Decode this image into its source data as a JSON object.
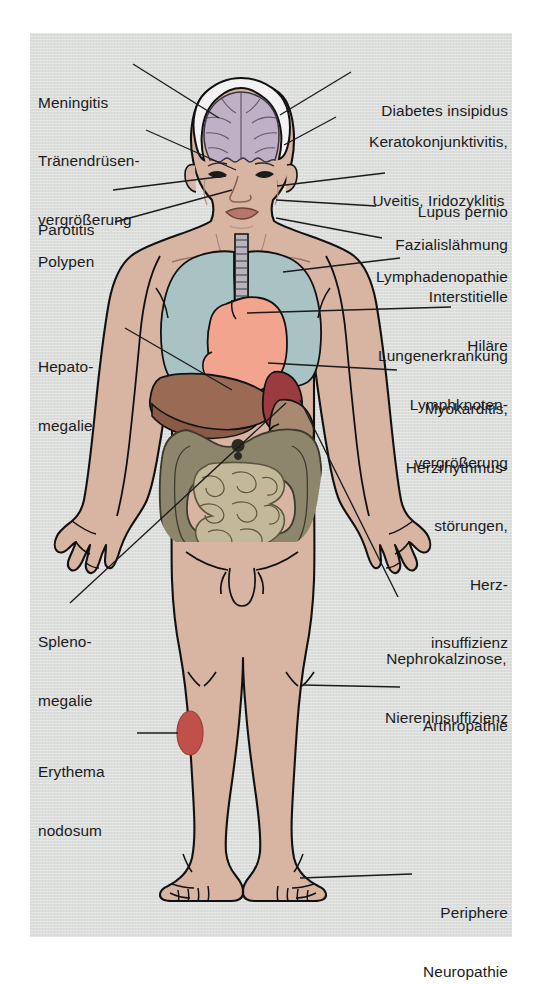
{
  "figure": {
    "background_color": "#dcdedc",
    "page_color": "#ffffff",
    "line_color": "#1b1b1b",
    "text_color": "#1b1b1b"
  },
  "palette": {
    "skin": "#d8b4a3",
    "skin_shadow": "#c59d8c",
    "brain": "#bfb0c6",
    "lung": "#a9c2c4",
    "heart": "#f2a48e",
    "liver": "#9a6a55",
    "liver_dark": "#8a5a47",
    "spleen": "#9a3b3f",
    "stomach": "#a88a72",
    "colon": "#8d866c",
    "small_bowel": "#c3b99a",
    "trachea": "#b9b4bc",
    "erythema": "#c0504a",
    "outline": "#111111"
  },
  "labels": {
    "left": [
      {
        "id": "meningitis",
        "text": "Meningitis",
        "lines": [
          "Meningitis"
        ]
      },
      {
        "id": "traenendruesenvergroesserung",
        "text": "Tränendrüsen-vergrößerung",
        "lines": [
          "Tränendrüsen-",
          "vergrößerung"
        ]
      },
      {
        "id": "parotitis",
        "text": "Parotitis",
        "lines": [
          "Parotitis"
        ]
      },
      {
        "id": "polypen",
        "text": "Polypen",
        "lines": [
          "Polypen"
        ]
      },
      {
        "id": "hepatomegalie",
        "text": "Hepatomegalie",
        "lines": [
          "Hepato-",
          "megalie"
        ]
      },
      {
        "id": "splenomegalie",
        "text": "Splenomegalie",
        "lines": [
          "Spleno-",
          "megalie"
        ]
      },
      {
        "id": "erythema-nodosum",
        "text": "Erythema nodosum",
        "lines": [
          "Erythema",
          "nodosum"
        ]
      }
    ],
    "right": [
      {
        "id": "diabetes-insipidus",
        "text": "Diabetes insipidus",
        "lines": [
          "Diabetes insipidus"
        ]
      },
      {
        "id": "keratokonjunktivitis",
        "text": "Keratokonjunktivitis, Uveitis, Iridozyklitis",
        "lines": [
          "Keratokonjunktivitis,",
          "Uveitis, Iridozyklitis"
        ]
      },
      {
        "id": "lupus-pernio",
        "text": "Lupus pernio",
        "lines": [
          "Lupus pernio"
        ]
      },
      {
        "id": "fazialislaehmung",
        "text": "Fazialislähmung",
        "lines": [
          "Fazialislähmung"
        ]
      },
      {
        "id": "lymphadenopathie",
        "text": "Lymphadenopathie",
        "lines": [
          "Lymphadenopathie"
        ]
      },
      {
        "id": "interstitielle-lungenerkrankung",
        "text": "Interstitielle Lungenerkrankung",
        "lines": [
          "Interstitielle",
          "Lungenerkrankung"
        ]
      },
      {
        "id": "hilaere-lymphknotenvergroesserung",
        "text": "Hiläre Lymphknotenvergrößerung",
        "lines": [
          "Hiläre",
          "Lymphknoten-",
          "vergrößerung"
        ]
      },
      {
        "id": "myokarditis",
        "text": "Myokarditis, Herzrhythmusstörungen, Herzinsuffizienz",
        "lines": [
          "Myokarditis,",
          "Herzrhythmus-",
          "störungen,",
          "Herz-",
          "insuffizienz"
        ]
      },
      {
        "id": "nephrokalzinose",
        "text": "Nephrokalzinose, Niereninsuffizienz",
        "lines": [
          "Nephrokalzinose,",
          "Niereninsuffizienz"
        ]
      },
      {
        "id": "arthropathie",
        "text": "Arthropathie",
        "lines": [
          "Arthropathie"
        ]
      },
      {
        "id": "periphere-neuropathie",
        "text": "Periphere Neuropathie",
        "lines": [
          "Periphere",
          "Neuropathie"
        ]
      }
    ]
  },
  "label_text": {
    "meningitis_l1": "Meningitis",
    "traenen_l1": "Tränendrüsen-",
    "traenen_l2": "vergrößerung",
    "parotitis_l1": "Parotitis",
    "polypen_l1": "Polypen",
    "hepato_l1": "Hepato-",
    "hepato_l2": "megalie",
    "spleno_l1": "Spleno-",
    "spleno_l2": "megalie",
    "erythema_l1": "Erythema",
    "erythema_l2": "nodosum",
    "diabetes_l1": "Diabetes insipidus",
    "kerato_l1": "Keratokonjunktivitis,",
    "kerato_l2": "Uveitis, Iridozyklitis",
    "lupus_l1": "Lupus pernio",
    "fazialis_l1": "Fazialislähmung",
    "lymphadeno_l1": "Lymphadenopathie",
    "interst_l1": "Interstitielle",
    "interst_l2": "Lungenerkrankung",
    "hilaer_l1": "Hiläre",
    "hilaer_l2": "Lymphknoten-",
    "hilaer_l3": "vergrößerung",
    "myokard_l1": "Myokarditis,",
    "myokard_l2": "Herzrhythmus-",
    "myokard_l3": "störungen,",
    "myokard_l4": "Herz-",
    "myokard_l5": "insuffizienz",
    "nephro_l1": "Nephrokalzinose,",
    "nephro_l2": "Niereninsuffizienz",
    "arthro_l1": "Arthropathie",
    "periph_l1": "Periphere",
    "periph_l2": "Neuropathie"
  },
  "anatomy": {
    "organs": [
      {
        "id": "brain",
        "name": "Gehirn",
        "color": "#bfb0c6"
      },
      {
        "id": "lungs",
        "name": "Lungen",
        "color": "#a9c2c4"
      },
      {
        "id": "heart",
        "name": "Herz",
        "color": "#f2a48e"
      },
      {
        "id": "trachea",
        "name": "Trachea",
        "color": "#b9b4bc"
      },
      {
        "id": "liver",
        "name": "Leber",
        "color": "#9a6a55"
      },
      {
        "id": "spleen",
        "name": "Milz",
        "color": "#9a3b3f"
      },
      {
        "id": "stomach",
        "name": "Magen",
        "color": "#a88a72"
      },
      {
        "id": "colon",
        "name": "Dickdarm",
        "color": "#8d866c"
      },
      {
        "id": "small-bowel",
        "name": "Dünndarm",
        "color": "#c3b99a"
      },
      {
        "id": "erythema-nodosum-lesion",
        "name": "Erythema nodosum",
        "color": "#c0504a"
      }
    ]
  }
}
